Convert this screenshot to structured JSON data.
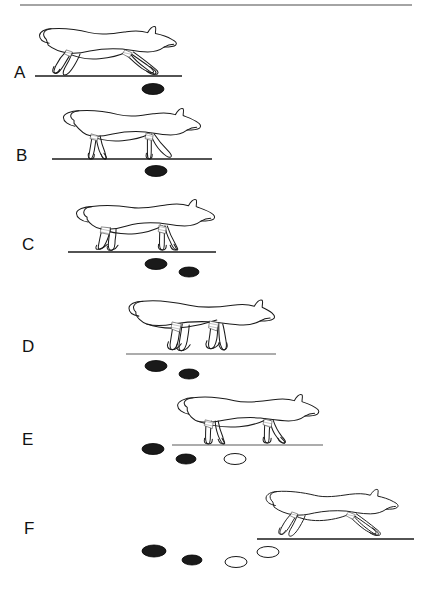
{
  "figure": {
    "type": "sequence-diagram",
    "background_color": "#ffffff",
    "ink_color": "#1a1a1a",
    "footprint_fill_dark": "#1a1a1a",
    "footprint_fill_light": "#ffffff",
    "top_rule": {
      "x1": 20,
      "x2": 412,
      "y": 5
    },
    "panels": [
      {
        "id": "A",
        "label": "A",
        "label_x": 14,
        "label_y": 64,
        "ground_line": {
          "x1": 35,
          "x2": 182,
          "y": 76
        },
        "animal": {
          "pose": "extended-suspension",
          "x": 36,
          "y": 22,
          "w": 148,
          "h": 56,
          "facing": "right"
        },
        "footprints": [
          {
            "cx": 153,
            "cy": 89,
            "rx": 11,
            "ry": 5.5,
            "fill": "dark"
          }
        ]
      },
      {
        "id": "B",
        "label": "B",
        "label_x": 16,
        "label_y": 147,
        "ground_line": {
          "x1": 52,
          "x2": 212,
          "y": 159
        },
        "animal": {
          "pose": "hind-contact-gathered",
          "x": 57,
          "y": 104,
          "w": 148,
          "h": 56,
          "facing": "right"
        },
        "footprints": [
          {
            "cx": 156,
            "cy": 171,
            "rx": 11,
            "ry": 5.5,
            "fill": "dark"
          }
        ]
      },
      {
        "id": "C",
        "label": "C",
        "label_x": 22,
        "label_y": 236,
        "ground_line": {
          "x1": 68,
          "x2": 216,
          "y": 252
        },
        "animal": {
          "pose": "gathered-crouch",
          "x": 72,
          "y": 196,
          "w": 148,
          "h": 56,
          "facing": "right"
        },
        "footprints": [
          {
            "cx": 156,
            "cy": 264,
            "rx": 11,
            "ry": 5.5,
            "fill": "dark"
          },
          {
            "cx": 189,
            "cy": 272,
            "rx": 10,
            "ry": 5,
            "fill": "dark"
          }
        ]
      },
      {
        "id": "D",
        "label": "D",
        "label_x": 22,
        "label_y": 338,
        "ground_line": {
          "x1": 126,
          "x2": 276,
          "y": 354
        },
        "animal": {
          "pose": "push-off-extension",
          "x": 128,
          "y": 296,
          "w": 148,
          "h": 58,
          "facing": "right"
        },
        "footprints": [
          {
            "cx": 156,
            "cy": 366,
            "rx": 11,
            "ry": 5.5,
            "fill": "dark"
          },
          {
            "cx": 189,
            "cy": 374,
            "rx": 10,
            "ry": 5,
            "fill": "dark"
          }
        ]
      },
      {
        "id": "E",
        "label": "E",
        "label_x": 22,
        "label_y": 431,
        "ground_line": {
          "x1": 172,
          "x2": 323,
          "y": 445
        },
        "animal": {
          "pose": "fore-contact-upright",
          "x": 174,
          "y": 391,
          "w": 148,
          "h": 54,
          "facing": "right"
        },
        "footprints": [
          {
            "cx": 153,
            "cy": 449,
            "rx": 11,
            "ry": 5.5,
            "fill": "dark"
          },
          {
            "cx": 186,
            "cy": 459,
            "rx": 10,
            "ry": 5,
            "fill": "dark"
          },
          {
            "cx": 235,
            "cy": 459,
            "rx": 11,
            "ry": 5.5,
            "fill": "light"
          }
        ]
      },
      {
        "id": "F",
        "label": "F",
        "label_x": 24,
        "label_y": 520,
        "ground_line": {
          "x1": 257,
          "x2": 414,
          "y": 539
        },
        "animal": {
          "pose": "extended-suspension",
          "x": 259,
          "y": 485,
          "w": 150,
          "h": 54,
          "facing": "right"
        },
        "footprints": [
          {
            "cx": 154,
            "cy": 551,
            "rx": 12,
            "ry": 6,
            "fill": "dark"
          },
          {
            "cx": 192,
            "cy": 560,
            "rx": 10,
            "ry": 5,
            "fill": "dark"
          },
          {
            "cx": 236,
            "cy": 562,
            "rx": 11,
            "ry": 5.5,
            "fill": "light"
          },
          {
            "cx": 268,
            "cy": 552,
            "rx": 11,
            "ry": 5.5,
            "fill": "light"
          }
        ]
      }
    ]
  }
}
